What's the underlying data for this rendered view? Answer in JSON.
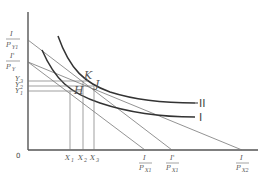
{
  "diagram": {
    "type": "indifference-curve budget-line diagram",
    "origin_label": "0",
    "y_axis_labels": [
      {
        "num": "I",
        "den": "P",
        "sub": "Y1",
        "y": 40
      },
      {
        "num": "I'",
        "den": "P",
        "sub": "Y",
        "y": 62
      }
    ],
    "y_ticks": [
      {
        "label": "Y",
        "sub": "3",
        "y": 81
      },
      {
        "label": "Y",
        "sub": "2",
        "y": 86
      },
      {
        "label": "Y",
        "sub": "1",
        "y": 91
      }
    ],
    "x_ticks": [
      {
        "label": "X",
        "sub": "1",
        "x": 70
      },
      {
        "label": "X",
        "sub": "2",
        "x": 83
      },
      {
        "label": "X",
        "sub": "3",
        "x": 94
      }
    ],
    "x_axis_labels": [
      {
        "num": "I",
        "den": "P",
        "sub": "X1",
        "x": 145
      },
      {
        "num": "I'",
        "den": "P",
        "sub": "X1",
        "x": 172
      },
      {
        "num": "I",
        "den": "P",
        "sub": "X2",
        "x": 242
      }
    ],
    "points": [
      {
        "label": "H",
        "x": 80,
        "y": 91
      },
      {
        "label": "K",
        "x": 86,
        "y": 79
      },
      {
        "label": "J",
        "x": 94,
        "y": 86
      }
    ],
    "curves": [
      {
        "label": "II"
      },
      {
        "label": "I"
      }
    ]
  }
}
